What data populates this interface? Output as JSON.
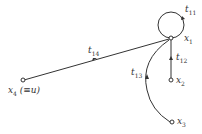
{
  "diagram": {
    "type": "signal-flow-graph",
    "nodes": [
      {
        "id": "x1",
        "label": "x",
        "sub": "1",
        "extra": ""
      },
      {
        "id": "x2",
        "label": "x",
        "sub": "2",
        "extra": ""
      },
      {
        "id": "x3",
        "label": "x",
        "sub": "3",
        "extra": ""
      },
      {
        "id": "x4",
        "label": "x",
        "sub": "4",
        "extra": " (≡u)"
      }
    ],
    "edges": [
      {
        "id": "t11",
        "label": "t",
        "sub": "11",
        "from": "x1",
        "to": "x1"
      },
      {
        "id": "t12",
        "label": "t",
        "sub": "12",
        "from": "x2",
        "to": "x1"
      },
      {
        "id": "t13",
        "label": "t",
        "sub": "13",
        "from": "x3",
        "to": "x1"
      },
      {
        "id": "t14",
        "label": "t",
        "sub": "14",
        "from": "x4",
        "to": "x1"
      }
    ],
    "colors": {
      "line": "#333333",
      "background": "#ffffff"
    }
  }
}
